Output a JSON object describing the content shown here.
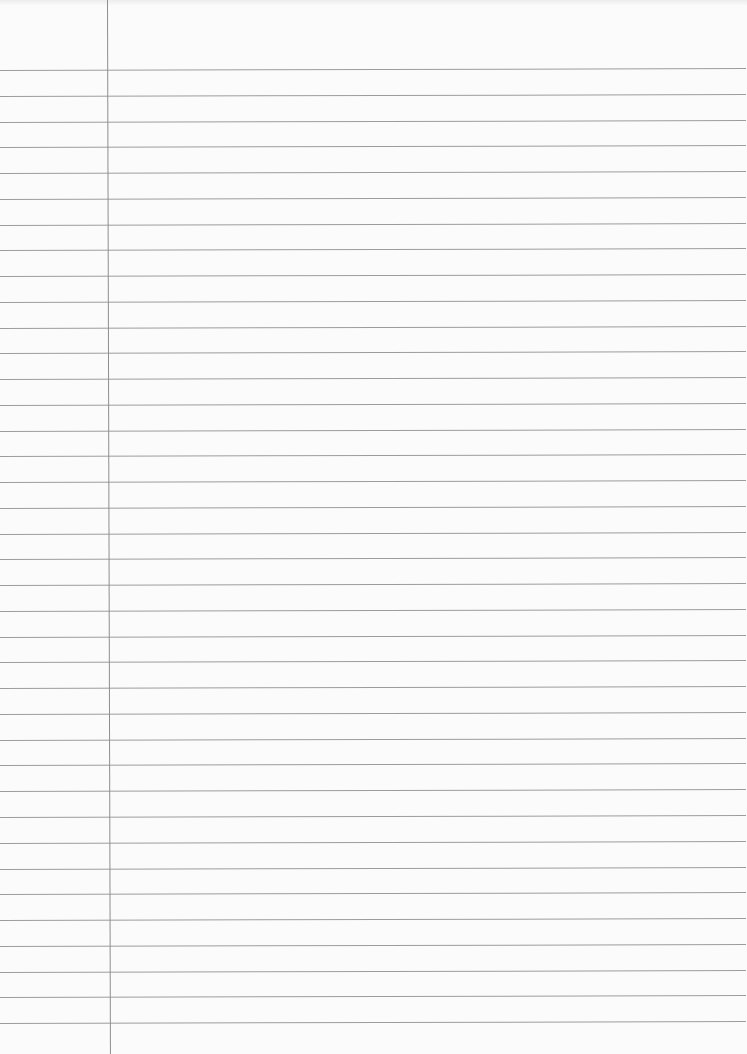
{
  "page": {
    "type": "lined-paper",
    "title": "",
    "background_color": "#fbfbfb",
    "rule_color": "#9c9c9c",
    "margin_color": "#8e8e8e"
  },
  "rules": {
    "count": 38,
    "first_y": 70,
    "last_y": 1023,
    "spacing": 25.76
  },
  "margin": {
    "x": 107
  }
}
